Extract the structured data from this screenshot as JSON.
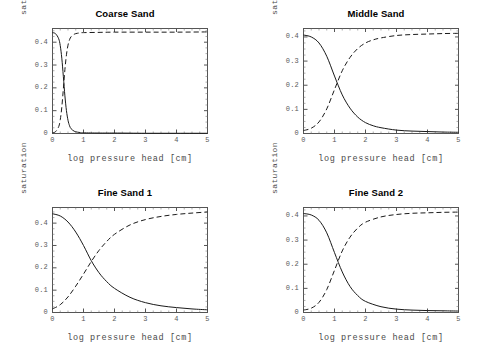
{
  "figure": {
    "background": "#ffffff",
    "axis_color": "#555555",
    "curve_color": "#1a1a1a",
    "panel_count": 4
  },
  "common": {
    "xlabel": "log pressure head [cm]",
    "ylabel": "saturation",
    "xticks": [
      "0",
      "1",
      "2",
      "3",
      "4",
      "5"
    ],
    "xtick_values": [
      0,
      1,
      2,
      3,
      4,
      5
    ]
  },
  "chart_data": [
    {
      "type": "line",
      "title": "Coarse Sand",
      "xlabel": "log pressure head [cm]",
      "ylabel": "saturation",
      "xlim": [
        0,
        5
      ],
      "ylim": [
        0,
        0.46
      ],
      "xticks": [
        0,
        1,
        2,
        3,
        4,
        5
      ],
      "yticks": [
        0,
        0.1,
        0.2,
        0.3,
        0.4
      ],
      "ytick_labels": [
        "0",
        "0.1",
        "0.2",
        "0.3",
        "0.4"
      ],
      "grid": false,
      "legend": "none",
      "series": [
        {
          "name": "water saturation",
          "style": "solid",
          "x": [
            0,
            0.1,
            0.2,
            0.25,
            0.3,
            0.35,
            0.4,
            0.45,
            0.5,
            0.55,
            0.6,
            0.7,
            0.8,
            0.9,
            1.0,
            1.5,
            2.0,
            3.0,
            4.0,
            5.0
          ],
          "values": [
            0.442,
            0.437,
            0.415,
            0.385,
            0.33,
            0.25,
            0.165,
            0.1,
            0.058,
            0.034,
            0.021,
            0.01,
            0.006,
            0.004,
            0.003,
            0.002,
            0.002,
            0.001,
            0.001,
            0.001
          ]
        },
        {
          "name": "air saturation",
          "style": "dashed",
          "x": [
            0,
            0.1,
            0.2,
            0.25,
            0.3,
            0.35,
            0.4,
            0.45,
            0.5,
            0.55,
            0.6,
            0.7,
            0.8,
            0.9,
            1.0,
            1.5,
            2.0,
            3.0,
            4.0,
            5.0
          ],
          "values": [
            0.003,
            0.008,
            0.03,
            0.06,
            0.115,
            0.195,
            0.28,
            0.345,
            0.387,
            0.411,
            0.424,
            0.435,
            0.439,
            0.441,
            0.442,
            0.443,
            0.444,
            0.444,
            0.444,
            0.445
          ]
        }
      ]
    },
    {
      "type": "line",
      "title": "Middle Sand",
      "xlabel": "log pressure head [cm]",
      "ylabel": "saturation",
      "xlim": [
        0,
        5
      ],
      "ylim": [
        0,
        0.435
      ],
      "xticks": [
        0,
        1,
        2,
        3,
        4,
        5
      ],
      "yticks": [
        0,
        0.1,
        0.2,
        0.3,
        0.4
      ],
      "ytick_labels": [
        "0",
        "0.1",
        "0.2",
        "0.3",
        "0.4"
      ],
      "grid": false,
      "legend": "none",
      "series": [
        {
          "name": "water saturation",
          "style": "solid",
          "x": [
            0,
            0.25,
            0.5,
            0.75,
            1.0,
            1.25,
            1.5,
            1.75,
            2.0,
            2.25,
            2.5,
            3.0,
            3.5,
            4.0,
            4.5,
            5.0
          ],
          "values": [
            0.408,
            0.4,
            0.375,
            0.32,
            0.238,
            0.16,
            0.105,
            0.068,
            0.045,
            0.032,
            0.024,
            0.014,
            0.01,
            0.008,
            0.006,
            0.005
          ]
        },
        {
          "name": "air saturation",
          "style": "dashed",
          "x": [
            0,
            0.25,
            0.5,
            0.75,
            1.0,
            1.25,
            1.5,
            1.75,
            2.0,
            2.25,
            2.5,
            3.0,
            3.5,
            4.0,
            4.5,
            5.0
          ],
          "values": [
            0.012,
            0.022,
            0.048,
            0.102,
            0.182,
            0.26,
            0.315,
            0.352,
            0.375,
            0.388,
            0.396,
            0.406,
            0.41,
            0.412,
            0.414,
            0.415
          ]
        }
      ]
    },
    {
      "type": "line",
      "title": "Fine Sand 1",
      "xlabel": "log pressure head [cm]",
      "ylabel": "saturation",
      "xlim": [
        0,
        5
      ],
      "ylim": [
        0,
        0.47
      ],
      "xticks": [
        0,
        1,
        2,
        3,
        4,
        5
      ],
      "yticks": [
        0,
        0.1,
        0.2,
        0.3,
        0.4
      ],
      "ytick_labels": [
        "0",
        "0.1",
        "0.2",
        "0.3",
        "0.4"
      ],
      "grid": false,
      "legend": "none",
      "series": [
        {
          "name": "water saturation",
          "style": "solid",
          "x": [
            0,
            0.25,
            0.5,
            0.75,
            1.0,
            1.25,
            1.5,
            1.75,
            2.0,
            2.5,
            3.0,
            3.5,
            4.0,
            4.5,
            5.0
          ],
          "values": [
            0.442,
            0.432,
            0.405,
            0.36,
            0.3,
            0.232,
            0.178,
            0.138,
            0.108,
            0.068,
            0.044,
            0.03,
            0.022,
            0.016,
            0.012
          ]
        },
        {
          "name": "air saturation",
          "style": "dashed",
          "x": [
            0,
            0.25,
            0.5,
            0.75,
            1.0,
            1.25,
            1.5,
            1.75,
            2.0,
            2.5,
            3.0,
            3.5,
            4.0,
            4.5,
            5.0
          ],
          "values": [
            0.016,
            0.035,
            0.07,
            0.118,
            0.172,
            0.228,
            0.278,
            0.318,
            0.35,
            0.392,
            0.416,
            0.43,
            0.439,
            0.445,
            0.45
          ]
        }
      ]
    },
    {
      "type": "line",
      "title": "Fine Sand 2",
      "xlabel": "log pressure head [cm]",
      "ylabel": "saturation",
      "xlim": [
        0,
        5
      ],
      "ylim": [
        0,
        0.435
      ],
      "xticks": [
        0,
        1,
        2,
        3,
        4,
        5
      ],
      "yticks": [
        0,
        0.1,
        0.2,
        0.3,
        0.4
      ],
      "ytick_labels": [
        "0",
        "0.1",
        "0.2",
        "0.3",
        "0.4"
      ],
      "grid": false,
      "legend": "none",
      "series": [
        {
          "name": "water saturation",
          "style": "solid",
          "x": [
            0,
            0.25,
            0.5,
            0.75,
            1.0,
            1.25,
            1.5,
            1.75,
            2.0,
            2.5,
            3.0,
            3.5,
            4.0,
            4.5,
            5.0
          ],
          "values": [
            0.41,
            0.404,
            0.382,
            0.33,
            0.248,
            0.168,
            0.108,
            0.07,
            0.046,
            0.024,
            0.014,
            0.01,
            0.008,
            0.007,
            0.006
          ]
        },
        {
          "name": "air saturation",
          "style": "dashed",
          "x": [
            0,
            0.25,
            0.5,
            0.75,
            1.0,
            1.25,
            1.5,
            1.75,
            2.0,
            2.5,
            3.0,
            3.5,
            4.0,
            4.5,
            5.0
          ],
          "values": [
            0.01,
            0.018,
            0.042,
            0.095,
            0.175,
            0.255,
            0.312,
            0.35,
            0.374,
            0.396,
            0.406,
            0.411,
            0.413,
            0.415,
            0.416
          ]
        }
      ]
    }
  ]
}
